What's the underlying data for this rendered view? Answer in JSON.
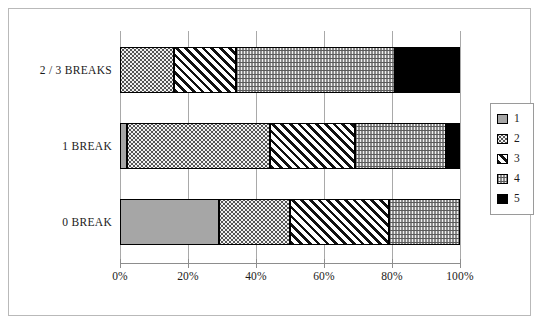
{
  "chart_data": {
    "type": "bar",
    "orientation": "horizontal",
    "stacked": true,
    "normalized_percent": true,
    "title": "",
    "xlabel": "",
    "ylabel": "",
    "xlim": [
      0,
      100
    ],
    "grid": true,
    "legend_position": "right",
    "categories": [
      "0 BREAK",
      "1 BREAK",
      "2 / 3 BREAKS"
    ],
    "legend": [
      "1",
      "2",
      "3",
      "4",
      "5"
    ],
    "xticks": [
      "0%",
      "20%",
      "40%",
      "60%",
      "80%",
      "100%"
    ],
    "xtick_values": [
      0,
      20,
      40,
      60,
      80,
      100
    ],
    "series": [
      {
        "name": "1",
        "values": [
          29,
          2,
          0
        ]
      },
      {
        "name": "2",
        "values": [
          21,
          42,
          16
        ]
      },
      {
        "name": "3",
        "values": [
          29,
          25,
          18
        ]
      },
      {
        "name": "4",
        "values": [
          21,
          27,
          47
        ]
      },
      {
        "name": "5",
        "values": [
          0,
          4,
          19
        ]
      }
    ],
    "cumulative_boundaries": {
      "0 BREAK": [
        0,
        29,
        50,
        79,
        100,
        100
      ],
      "1 BREAK": [
        0,
        2,
        44,
        69,
        96,
        100
      ],
      "2 / 3 BREAKS": [
        0,
        0,
        16,
        34,
        81,
        100
      ]
    },
    "patterns": {
      "1": "solid-grey",
      "2": "fine-dots",
      "3": "diagonal-hatch",
      "4": "wavy-lines",
      "5": "solid-black"
    },
    "colors": {
      "series1": "#a6a6a6",
      "series2": "#f2f2f2",
      "series3": "#ffffff",
      "series4": "#efefef",
      "series5": "#000000",
      "outline": "#000000",
      "gridline": "#a9a9a9",
      "frame": "#b9b9b9"
    }
  },
  "bars": [
    {
      "label": "2 / 3 BREAKS",
      "segments": [
        {
          "series": "2",
          "start": 0,
          "end": 16,
          "pattern": "p2"
        },
        {
          "series": "3",
          "start": 16,
          "end": 34,
          "pattern": "p3"
        },
        {
          "series": "4",
          "start": 34,
          "end": 81,
          "pattern": "p4"
        },
        {
          "series": "5",
          "start": 81,
          "end": 100,
          "pattern": "p5"
        }
      ]
    },
    {
      "label": "1 BREAK",
      "segments": [
        {
          "series": "1",
          "start": 0,
          "end": 2,
          "pattern": "p1"
        },
        {
          "series": "2",
          "start": 2,
          "end": 44,
          "pattern": "p2"
        },
        {
          "series": "3",
          "start": 44,
          "end": 69,
          "pattern": "p3"
        },
        {
          "series": "4",
          "start": 69,
          "end": 96,
          "pattern": "p4"
        },
        {
          "series": "5",
          "start": 96,
          "end": 100,
          "pattern": "p5"
        }
      ]
    },
    {
      "label": "0 BREAK",
      "segments": [
        {
          "series": "1",
          "start": 0,
          "end": 29,
          "pattern": "p1"
        },
        {
          "series": "2",
          "start": 29,
          "end": 50,
          "pattern": "p2"
        },
        {
          "series": "3",
          "start": 50,
          "end": 79,
          "pattern": "p3"
        },
        {
          "series": "4",
          "start": 79,
          "end": 100,
          "pattern": "p4"
        }
      ]
    }
  ],
  "legend": {
    "items": [
      {
        "label": "1",
        "pattern": "p1"
      },
      {
        "label": "2",
        "pattern": "p2"
      },
      {
        "label": "3",
        "pattern": "p3"
      },
      {
        "label": "4",
        "pattern": "p4"
      },
      {
        "label": "5",
        "pattern": "p5"
      }
    ]
  }
}
